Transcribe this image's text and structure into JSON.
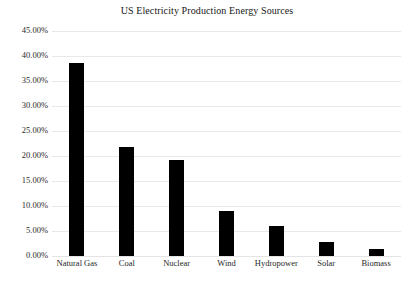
{
  "chart_data": {
    "type": "bar",
    "title": "US Electricity Production Energy Sources",
    "xlabel": "",
    "ylabel": "",
    "categories": [
      "Natural Gas",
      "Coal",
      "Nuclear",
      "Wind",
      "Hydropower",
      "Solar",
      "Biomass"
    ],
    "values": [
      38.7,
      21.9,
      19.2,
      9.1,
      6.1,
      2.9,
      1.5
    ],
    "value_unit": "%",
    "ylim": [
      0,
      45
    ],
    "ytick_values": [
      0,
      5,
      10,
      15,
      20,
      25,
      30,
      35,
      40,
      45
    ],
    "ytick_labels": [
      "0.00%",
      "5.00%",
      "10.00%",
      "15.00%",
      "20.00%",
      "25.00%",
      "30.00%",
      "35.00%",
      "40.00%",
      "45.00%"
    ],
    "grid": "horizontal",
    "legend": "none",
    "bar_color": "#000000",
    "gridline_color": "#e9e9e9",
    "background_color": "#ffffff"
  }
}
